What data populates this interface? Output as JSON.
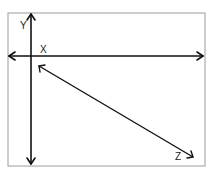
{
  "diagram": {
    "title": "",
    "axes": [
      {
        "name": "Y",
        "label": "Y",
        "orientation": "vertical",
        "bidirectional": true
      },
      {
        "name": "X",
        "label": "X",
        "orientation": "horizontal",
        "bidirectional": true
      },
      {
        "name": "Z",
        "label": "Z",
        "orientation": "diagonal",
        "bidirectional": true
      }
    ],
    "colors": {
      "line": "#111111",
      "frame": "#9a9a9a",
      "background": "#ffffff"
    }
  }
}
